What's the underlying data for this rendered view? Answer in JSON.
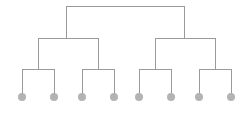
{
  "figure": {
    "title": "",
    "type": "binary-tree-dendrogram",
    "width": 245,
    "height": 114,
    "background": "#ffffff"
  },
  "style": {
    "edge_color": "#9a9a9a",
    "edge_width": 1,
    "node_color": "#b3b3b3",
    "node_radius": 4
  },
  "chart_data": {
    "type": "tree",
    "title": "",
    "xlabel": "",
    "ylabel": "",
    "orientation": "top-down",
    "depth": 4,
    "leaf_count": 8,
    "levels": [
      {
        "name": "root",
        "y": 6
      },
      {
        "name": "level-2",
        "y": 38
      },
      {
        "name": "level-3",
        "y": 69
      },
      {
        "name": "leaves",
        "y": 97
      }
    ],
    "links": [
      {
        "id": "root-bar",
        "kind": "horizontal",
        "y": 6,
        "x1": 66,
        "x2": 184
      },
      {
        "id": "root-stem-left",
        "kind": "vertical",
        "x": 66,
        "y1": 6,
        "y2": 38
      },
      {
        "id": "root-stem-right",
        "kind": "vertical",
        "x": 184,
        "y1": 6,
        "y2": 38
      },
      {
        "id": "level2-bar-left",
        "kind": "horizontal",
        "y": 38,
        "x1": 38,
        "x2": 98
      },
      {
        "id": "level2-bar-right",
        "kind": "horizontal",
        "y": 38,
        "x1": 155,
        "x2": 215
      },
      {
        "id": "level2-stem-a",
        "kind": "vertical",
        "x": 38,
        "y1": 38,
        "y2": 69
      },
      {
        "id": "level2-stem-b",
        "kind": "vertical",
        "x": 98,
        "y1": 38,
        "y2": 69
      },
      {
        "id": "level2-stem-c",
        "kind": "vertical",
        "x": 155,
        "y1": 38,
        "y2": 69
      },
      {
        "id": "level2-stem-d",
        "kind": "vertical",
        "x": 215,
        "y1": 38,
        "y2": 69
      },
      {
        "id": "level3-bar-1",
        "kind": "horizontal",
        "y": 69,
        "x1": 22,
        "x2": 54
      },
      {
        "id": "level3-bar-2",
        "kind": "horizontal",
        "y": 69,
        "x1": 82,
        "x2": 114
      },
      {
        "id": "level3-bar-3",
        "kind": "horizontal",
        "y": 69,
        "x1": 139,
        "x2": 171
      },
      {
        "id": "level3-bar-4",
        "kind": "horizontal",
        "y": 69,
        "x1": 199,
        "x2": 231
      },
      {
        "id": "leaf-stem-1",
        "kind": "vertical",
        "x": 22,
        "y1": 69,
        "y2": 97
      },
      {
        "id": "leaf-stem-2",
        "kind": "vertical",
        "x": 54,
        "y1": 69,
        "y2": 97
      },
      {
        "id": "leaf-stem-3",
        "kind": "vertical",
        "x": 82,
        "y1": 69,
        "y2": 97
      },
      {
        "id": "leaf-stem-4",
        "kind": "vertical",
        "x": 114,
        "y1": 69,
        "y2": 97
      },
      {
        "id": "leaf-stem-5",
        "kind": "vertical",
        "x": 139,
        "y1": 69,
        "y2": 97
      },
      {
        "id": "leaf-stem-6",
        "kind": "vertical",
        "x": 171,
        "y1": 69,
        "y2": 97
      },
      {
        "id": "leaf-stem-7",
        "kind": "vertical",
        "x": 199,
        "y1": 69,
        "y2": 97
      },
      {
        "id": "leaf-stem-8",
        "kind": "vertical",
        "x": 231,
        "y1": 69,
        "y2": 97
      }
    ],
    "nodes": [
      {
        "id": "leaf-1",
        "label": "",
        "x": 22,
        "y": 97
      },
      {
        "id": "leaf-2",
        "label": "",
        "x": 54,
        "y": 97
      },
      {
        "id": "leaf-3",
        "label": "",
        "x": 82,
        "y": 97
      },
      {
        "id": "leaf-4",
        "label": "",
        "x": 114,
        "y": 97
      },
      {
        "id": "leaf-5",
        "label": "",
        "x": 139,
        "y": 97
      },
      {
        "id": "leaf-6",
        "label": "",
        "x": 171,
        "y": 97
      },
      {
        "id": "leaf-7",
        "label": "",
        "x": 199,
        "y": 97
      },
      {
        "id": "leaf-8",
        "label": "",
        "x": 231,
        "y": 97
      }
    ]
  }
}
